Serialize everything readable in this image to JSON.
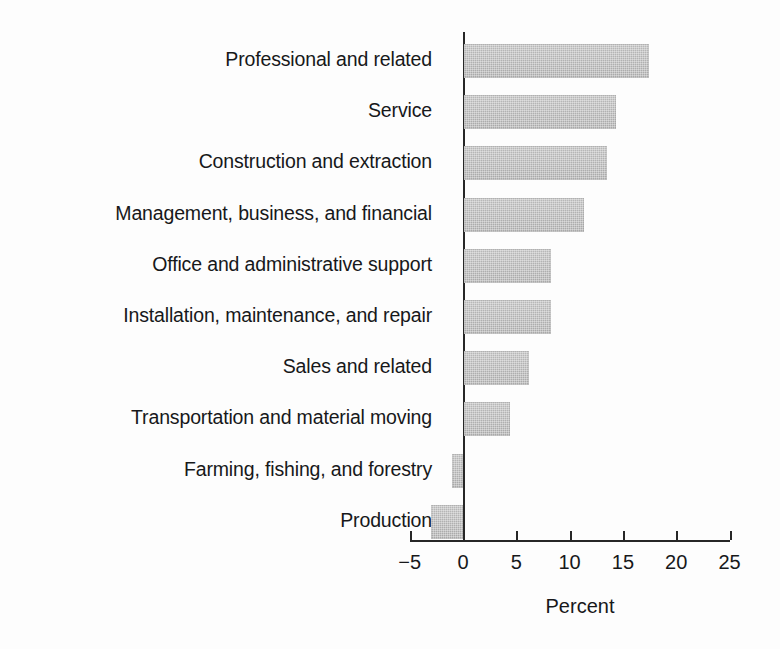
{
  "chart_data": {
    "type": "bar",
    "orientation": "horizontal",
    "title": "",
    "subtitle": "",
    "xlabel": "Percent",
    "ylabel": "",
    "categories": [
      "Professional and related",
      "Service",
      "Construction and extraction",
      "Management, business, and financial",
      "Office and administrative support",
      "Installation, maintenance, and repair",
      "Sales and related",
      "Transportation and material moving",
      "Farming, fishing, and forestry",
      "Production"
    ],
    "values": [
      17.4,
      14.3,
      13.4,
      11.3,
      8.2,
      8.2,
      6.1,
      4.3,
      -1.0,
      -3.0
    ],
    "xlim": [
      -5,
      25
    ],
    "xticks": [
      -5,
      0,
      5,
      10,
      15,
      20,
      25
    ],
    "xtick_labels": [
      "−5",
      "0",
      "5",
      "10",
      "15",
      "20",
      "25"
    ],
    "grid": false,
    "legend": false,
    "legend_position": "none",
    "bar_color": "#b3b3b3",
    "axis_color": "#272727",
    "background_color": "#fdfdfd"
  },
  "axis": {
    "x_title": "Percent"
  }
}
